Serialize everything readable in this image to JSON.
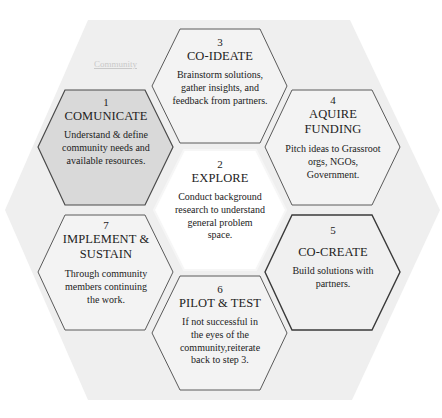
{
  "diagram": {
    "background_label": "Community",
    "colors": {
      "outer_hex_fill": "#efefef",
      "hex_fill": "#f2f2f2",
      "highlight_fill": "#d8d8d8",
      "center_fill": "#ffffff",
      "hex_border": "#5a5a5a",
      "emphasis_border": "#3a3a3a",
      "text": "#222222"
    },
    "steps": [
      {
        "number": "1",
        "title": "COMUNICATE",
        "description": "Understand & define community needs and available resources.",
        "position": "left-top",
        "highlighted": true
      },
      {
        "number": "2",
        "title": "EXPLORE",
        "description": "Conduct background research to understand general problem space.",
        "position": "center"
      },
      {
        "number": "3",
        "title": "CO-IDEATE",
        "description": "Brainstorm solutions, gather insights, and feedback from partners.",
        "position": "middle-top"
      },
      {
        "number": "4",
        "title": "AQUIRE FUNDING",
        "description": "Pitch ideas to Grassroot orgs, NGOs, Government.",
        "position": "right-top"
      },
      {
        "number": "5",
        "title": "CO-CREATE",
        "description": "Build solutions with partners.",
        "position": "right-bottom"
      },
      {
        "number": "6",
        "title": "PILOT & TEST",
        "description": "If not successful in the eyes of the community,reiterate back to step 3.",
        "position": "middle-bottom"
      },
      {
        "number": "7",
        "title": "IMPLEMENT & SUSTAIN",
        "description": "Through community members continuing the work.",
        "position": "left-bottom"
      }
    ]
  }
}
